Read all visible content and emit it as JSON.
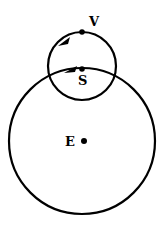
{
  "diagram": {
    "type": "orbit-epicycle",
    "labels": {
      "venus": "V",
      "sun": "S",
      "earth": "E"
    },
    "large_circle": {
      "cx": 82,
      "cy": 141,
      "r": 73
    },
    "small_circle": {
      "cx": 82,
      "cy": 66,
      "r": 34
    },
    "points": {
      "venus": {
        "x": 82,
        "y": 32
      },
      "sun": {
        "x": 82,
        "y": 69
      },
      "earth": {
        "x": 83,
        "y": 141
      }
    },
    "colors": {
      "stroke": "#000000",
      "background": "#ffffff"
    }
  }
}
